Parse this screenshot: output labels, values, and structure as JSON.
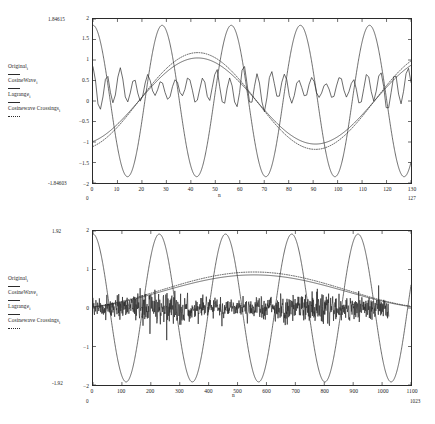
{
  "document": {
    "title": "Cosine wave crossing analysis plots",
    "background_color": "#ffffff",
    "ink_color": "#2b2b2b"
  },
  "legend": {
    "entries": [
      {
        "label": "Original",
        "sub": "i",
        "style": "solid"
      },
      {
        "label": "CosineWave",
        "sub": "i",
        "style": "solid"
      },
      {
        "label": "Lagrange",
        "sub": "i",
        "style": "solid"
      },
      {
        "label": "Cosinewave Crossings",
        "sub": "i",
        "style": "dotted"
      }
    ]
  },
  "chart_data": [
    {
      "type": "line",
      "id": "top-plot",
      "title": "",
      "xlabel": "n",
      "ylabel": "",
      "xlim": [
        0,
        130
      ],
      "ylim": [
        -2,
        2
      ],
      "x_ticks": [
        0,
        10,
        20,
        30,
        40,
        50,
        60,
        70,
        80,
        90,
        100,
        110,
        120,
        130
      ],
      "y_ticks": [
        2,
        1.5,
        1,
        0.5,
        0,
        -0.5,
        -1,
        -1.5,
        -2
      ],
      "y_top_annotation": "1.84615",
      "y_bottom_annotation": "-1.84603",
      "x_left_annotation": "0",
      "x_right_annotation": "127",
      "grid": false,
      "legend_position": "left-outside",
      "series": [
        {
          "name": "Original",
          "style": "solid",
          "description": "noisy oscillating signal centered near 0.3, amplitude about 0.35",
          "baseline": 0.3,
          "ripple_amplitude": 0.33,
          "ripple_period": 5.6
        },
        {
          "name": "CosineWave",
          "style": "solid",
          "description": "large cosine, amplitude 1.846, about 5 cycles across 0..127",
          "amplitude": 1.846,
          "cycles": 4.6,
          "phase_deg": 0
        },
        {
          "name": "Lagrange",
          "style": "solid",
          "description": "slow smooth curve rising from -1 to about 1 near n=30 then falling",
          "amplitude": 1.05,
          "cycles": 1.35,
          "phase_deg": 200
        },
        {
          "name": "Cosinewave Crossings",
          "style": "dotted",
          "description": "dotted curve close to Lagrange but slightly larger swing",
          "amplitude": 1.18,
          "cycles": 1.35,
          "phase_deg": 200
        }
      ]
    },
    {
      "type": "line",
      "id": "bottom-plot",
      "title": "",
      "xlabel": "n",
      "ylabel": "",
      "xlim": [
        0,
        1100
      ],
      "ylim": [
        -2,
        2
      ],
      "x_ticks": [
        0,
        100,
        200,
        300,
        400,
        500,
        600,
        700,
        800,
        900,
        1000,
        1100
      ],
      "y_ticks": [
        2,
        1,
        0,
        -1,
        -2
      ],
      "y_top_annotation": "1.92",
      "y_bottom_annotation": "-1.92",
      "x_left_annotation": "0",
      "x_right_annotation": "1023",
      "grid": false,
      "legend_position": "left-outside",
      "series": [
        {
          "name": "Original",
          "style": "solid",
          "description": "dense high frequency noise band centered at 0, amplitude about 0.3",
          "baseline": 0.0,
          "noise_amplitude": 0.3
        },
        {
          "name": "CosineWave",
          "style": "solid",
          "description": "large cosine amplitude 1.92, about 5 cycles across 0..1023",
          "amplitude": 1.92,
          "cycles": 4.8,
          "phase_deg": 0
        },
        {
          "name": "Lagrange",
          "style": "solid",
          "description": "slow single hump peaking near n=250 at about 0.85 then decaying",
          "amplitude": 0.88,
          "cycles": 0.85,
          "phase_deg": 205
        },
        {
          "name": "Cosinewave Crossings",
          "style": "dotted",
          "description": "dotted curve tracking the slow hump slightly above it",
          "amplitude": 0.95,
          "cycles": 0.85,
          "phase_deg": 205
        }
      ]
    }
  ]
}
